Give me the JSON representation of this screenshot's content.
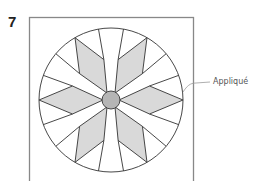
{
  "figure": {
    "step_number": "7",
    "callout_label": "Appliqué"
  },
  "block": {
    "frame": {
      "x": 29,
      "y": 17,
      "width": 164,
      "height": 170,
      "stroke": "#888888"
    },
    "circle": {
      "cx": 111,
      "cy": 100,
      "r": 72,
      "stroke": "#333333"
    },
    "center_circle": {
      "r": 9,
      "fill": "#b5b5b5",
      "stroke": "#333333"
    },
    "star": {
      "points": 6,
      "tip_angles_deg": [
        0,
        60,
        120,
        180,
        240,
        300
      ],
      "side_vertex_radius": 41,
      "side_vertex_offset_deg": 20,
      "point_fill": "#d9d9d9",
      "background_fill": "#ffffff",
      "line_color": "#333333"
    }
  },
  "leader": {
    "color": "#999999"
  }
}
